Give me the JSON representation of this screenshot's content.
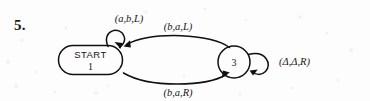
{
  "figure": {
    "item_number": "5.",
    "type": "turing-machine-state-diagram",
    "ink_color": "#101010",
    "background_color": "#fdfdfd"
  },
  "states": [
    {
      "id": "1",
      "shape": "stadium",
      "start_label": "START",
      "number_label": "1",
      "is_start": true
    },
    {
      "id": "3",
      "shape": "circle",
      "number_label": "3",
      "is_start": false
    }
  ],
  "transitions": [
    {
      "name": "self-loop-state-1",
      "from": "1",
      "to": "1",
      "label": "(a,b,L)",
      "read": "a",
      "write": "b",
      "move": "L",
      "position": "above-left"
    },
    {
      "name": "arc-3-to-1",
      "from": "3",
      "to": "1",
      "label": "(b,a,L)",
      "read": "b",
      "write": "a",
      "move": "L",
      "position": "upper-arc"
    },
    {
      "name": "arc-1-to-3",
      "from": "1",
      "to": "3",
      "label": "(b,a,R)",
      "read": "b",
      "write": "a",
      "move": "R",
      "position": "lower-arc"
    },
    {
      "name": "self-loop-state-3",
      "from": "3",
      "to": "3",
      "label": "(Δ,Δ,R)",
      "read": "Δ",
      "write": "Δ",
      "move": "R",
      "position": "right"
    }
  ]
}
